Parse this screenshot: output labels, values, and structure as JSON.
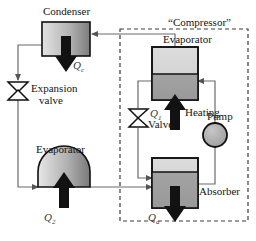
{
  "diagram": {
    "components": {
      "condenser": {
        "label": "Condenser",
        "heat_label": "Q",
        "heat_sub": "c"
      },
      "expansion_valve": {
        "label_line1": "Expansion",
        "label_line2": "valve"
      },
      "evaporator_left": {
        "label": "Evaporator",
        "heat_label": "Q",
        "heat_sub": "2"
      },
      "compressor_box": {
        "label": "“Compressor”"
      },
      "evaporator_inner": {
        "label": "Evaporator",
        "heat_label": "Q",
        "heat_sub": "1"
      },
      "heating": {
        "label": "Heating"
      },
      "valve_inner": {
        "label": "Valve"
      },
      "pump": {
        "label": "Pump"
      },
      "absorber": {
        "label": "Absorber",
        "heat_label": "Q",
        "heat_sub": "a"
      }
    },
    "colors": {
      "line": "#6b6b6b",
      "outline": "#111111",
      "arrow_fill": "#111111",
      "vessel_light": "#d9d9d9",
      "vessel_dark": "#8c8c8c",
      "pump_fill": "#a8a8a8",
      "text": "#141414",
      "dashed": "#3c3c3c"
    }
  }
}
